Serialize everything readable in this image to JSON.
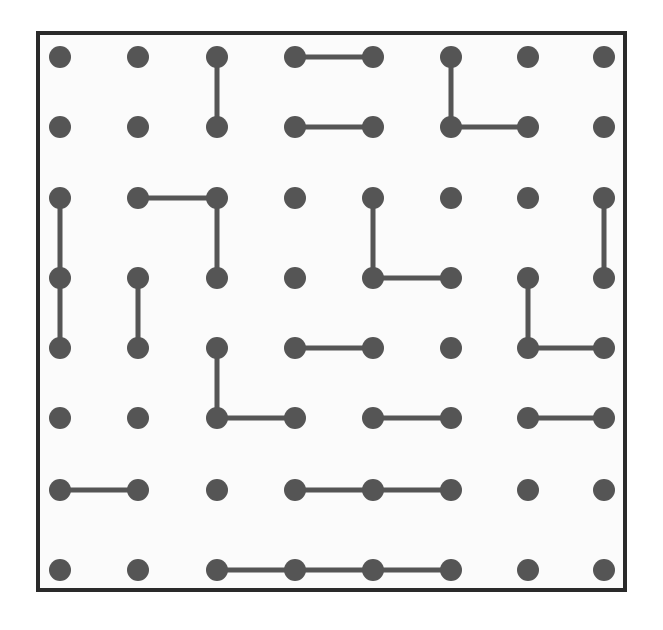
{
  "figure": {
    "title": "",
    "type": "dot-grid-matching-puzzle",
    "background_color": "#ffffff",
    "panel": {
      "name": "grid-panel",
      "x": 36,
      "y": 31,
      "width": 591,
      "height": 561,
      "fill_color": "#fbfbfb",
      "border_color": "#2a2a2a",
      "border_width": 4
    },
    "grid": {
      "columns": 8,
      "rows": 8,
      "column_x": [
        60,
        138,
        217,
        295,
        373,
        451,
        528,
        604
      ],
      "row_y": [
        57,
        127,
        198,
        278,
        348,
        418,
        490,
        570
      ],
      "dot_radius": 11,
      "dot_color": "#555555",
      "edge_color": "#555555",
      "edge_width": 5
    },
    "edges": [
      {
        "id": "e1",
        "from": [
          3,
          1
        ],
        "to": [
          3,
          2
        ],
        "orientation": "vertical"
      },
      {
        "id": "e2",
        "from": [
          4,
          1
        ],
        "to": [
          5,
          1
        ],
        "orientation": "horizontal"
      },
      {
        "id": "e3",
        "from": [
          6,
          1
        ],
        "to": [
          6,
          2
        ],
        "orientation": "vertical"
      },
      {
        "id": "e4",
        "from": [
          4,
          2
        ],
        "to": [
          5,
          2
        ],
        "orientation": "horizontal"
      },
      {
        "id": "e5",
        "from": [
          6,
          2
        ],
        "to": [
          7,
          2
        ],
        "orientation": "horizontal"
      },
      {
        "id": "e6",
        "from": [
          1,
          3
        ],
        "to": [
          1,
          4
        ],
        "orientation": "vertical"
      },
      {
        "id": "e7",
        "from": [
          2,
          3
        ],
        "to": [
          3,
          3
        ],
        "orientation": "horizontal"
      },
      {
        "id": "e8",
        "from": [
          3,
          3
        ],
        "to": [
          3,
          4
        ],
        "orientation": "vertical"
      },
      {
        "id": "e9",
        "from": [
          5,
          3
        ],
        "to": [
          5,
          4
        ],
        "orientation": "vertical"
      },
      {
        "id": "e10",
        "from": [
          8,
          3
        ],
        "to": [
          8,
          4
        ],
        "orientation": "vertical"
      },
      {
        "id": "e11",
        "from": [
          1,
          4
        ],
        "to": [
          1,
          5
        ],
        "orientation": "vertical"
      },
      {
        "id": "e12",
        "from": [
          2,
          4
        ],
        "to": [
          2,
          5
        ],
        "orientation": "vertical"
      },
      {
        "id": "e13",
        "from": [
          5,
          4
        ],
        "to": [
          6,
          4
        ],
        "orientation": "horizontal"
      },
      {
        "id": "e14",
        "from": [
          7,
          4
        ],
        "to": [
          7,
          5
        ],
        "orientation": "vertical"
      },
      {
        "id": "e15",
        "from": [
          3,
          5
        ],
        "to": [
          3,
          6
        ],
        "orientation": "vertical"
      },
      {
        "id": "e16",
        "from": [
          4,
          5
        ],
        "to": [
          5,
          5
        ],
        "orientation": "horizontal"
      },
      {
        "id": "e17",
        "from": [
          7,
          5
        ],
        "to": [
          8,
          5
        ],
        "orientation": "horizontal"
      },
      {
        "id": "e18",
        "from": [
          3,
          6
        ],
        "to": [
          4,
          6
        ],
        "orientation": "horizontal"
      },
      {
        "id": "e19",
        "from": [
          5,
          6
        ],
        "to": [
          6,
          6
        ],
        "orientation": "horizontal"
      },
      {
        "id": "e20",
        "from": [
          7,
          6
        ],
        "to": [
          8,
          6
        ],
        "orientation": "horizontal"
      },
      {
        "id": "e21",
        "from": [
          1,
          7
        ],
        "to": [
          2,
          7
        ],
        "orientation": "horizontal"
      },
      {
        "id": "e22",
        "from": [
          4,
          7
        ],
        "to": [
          5,
          7
        ],
        "orientation": "horizontal"
      },
      {
        "id": "e23",
        "from": [
          5,
          7
        ],
        "to": [
          6,
          7
        ],
        "orientation": "horizontal"
      },
      {
        "id": "e24",
        "from": [
          3,
          8
        ],
        "to": [
          4,
          8
        ],
        "orientation": "horizontal"
      },
      {
        "id": "e25",
        "from": [
          4,
          8
        ],
        "to": [
          5,
          8
        ],
        "orientation": "horizontal"
      },
      {
        "id": "e26",
        "from": [
          5,
          8
        ],
        "to": [
          6,
          8
        ],
        "orientation": "horizontal"
      }
    ]
  }
}
